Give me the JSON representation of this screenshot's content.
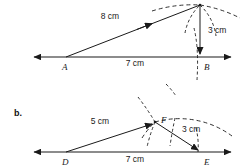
{
  "figure": {
    "parts": [
      {
        "id": "a",
        "part_label": "",
        "vertices": [
          {
            "name": "A",
            "label": "A",
            "x": 66,
            "y": 57
          },
          {
            "name": "B",
            "label": "B",
            "x": 200,
            "y": 57
          },
          {
            "name": "apex",
            "label": "",
            "x": 200,
            "y": 5
          }
        ],
        "dimensions": [
          {
            "name": "side-AC",
            "text": "8 cm",
            "x": 110,
            "y": 19
          },
          {
            "name": "base-AB",
            "text": "7 cm",
            "x": 135,
            "y": 66
          },
          {
            "name": "side-BC",
            "text": "3 cm",
            "x": 213,
            "y": 32
          }
        ]
      },
      {
        "id": "b",
        "part_label": "b.",
        "part_label_x": 14,
        "part_label_y": 113,
        "vertices": [
          {
            "name": "D",
            "label": "D",
            "x": 66,
            "y": 152
          },
          {
            "name": "E",
            "label": "E",
            "x": 200,
            "y": 152
          },
          {
            "name": "F",
            "label": "F",
            "x": 155,
            "y": 122
          }
        ],
        "dimensions": [
          {
            "name": "side-DF",
            "text": "5 cm",
            "x": 100,
            "y": 124
          },
          {
            "name": "base-DE",
            "text": "7 cm",
            "x": 135,
            "y": 162
          },
          {
            "name": "side-FE",
            "text": "3 cm",
            "x": 190,
            "y": 130
          }
        ]
      }
    ]
  },
  "colors": {
    "ink": "#1a1a1a",
    "background": "#ffffff"
  }
}
